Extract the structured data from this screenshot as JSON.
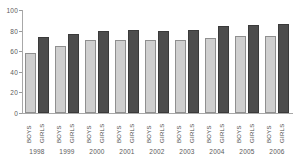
{
  "chart_data": {
    "type": "bar",
    "title": "",
    "subtitle": "",
    "xlabel": "",
    "ylabel": "",
    "ylim": [
      0,
      100
    ],
    "yticks": [
      0,
      20,
      40,
      60,
      80,
      100
    ],
    "ytick_labels": [
      "0",
      "20",
      "40",
      "60",
      "80",
      "100"
    ],
    "grid": false,
    "legend": null,
    "categories": [
      "1998",
      "1999",
      "2000",
      "2001",
      "2002",
      "2003",
      "2004",
      "2005",
      "2006"
    ],
    "series": [
      {
        "name": "BOYS",
        "color": "#cfcfcf",
        "values": [
          58,
          65,
          71,
          71,
          71,
          71,
          72.5,
          75,
          75
        ]
      },
      {
        "name": "GIRLS",
        "color": "#4d4d4d",
        "values": [
          74,
          77,
          80,
          81,
          80,
          81,
          84,
          85,
          86
        ]
      }
    ]
  },
  "axis": {
    "y_tick_labels": [
      "100",
      "80",
      "60",
      "40",
      "20",
      "0"
    ],
    "series_labels": [
      "BOYS",
      "GIRLS"
    ],
    "year_labels": [
      "1998",
      "1999",
      "2000",
      "2001",
      "2002",
      "2003",
      "2004",
      "2005",
      "2006"
    ]
  },
  "colors": {
    "boys_fill": "#cfcfcf",
    "boys_stroke": "#8f8f8f",
    "girls_fill": "#4d4d4d",
    "girls_stroke": "#3a3a3a",
    "axis": "#a8a8a8",
    "text": "#555555",
    "background": "#ffffff"
  }
}
